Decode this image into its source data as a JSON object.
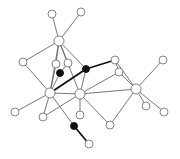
{
  "diagram": {
    "type": "network-graph",
    "nodes": [
      {
        "id": 0,
        "x": 52,
        "y": 14,
        "r": 4,
        "filled": false
      },
      {
        "id": 1,
        "x": 81,
        "y": 12,
        "r": 4,
        "filled": false
      },
      {
        "id": 2,
        "x": 59,
        "y": 41,
        "r": 5,
        "filled": false
      },
      {
        "id": 3,
        "x": 23,
        "y": 62,
        "r": 4,
        "filled": false
      },
      {
        "id": 4,
        "x": 56,
        "y": 64,
        "r": 4,
        "filled": false
      },
      {
        "id": 5,
        "x": 68,
        "y": 63,
        "r": 4,
        "filled": false
      },
      {
        "id": 6,
        "x": 60,
        "y": 73,
        "r": 3.5,
        "filled": true
      },
      {
        "id": 7,
        "x": 86,
        "y": 69,
        "r": 3.5,
        "filled": true
      },
      {
        "id": 8,
        "x": 115,
        "y": 60,
        "r": 4,
        "filled": false
      },
      {
        "id": 9,
        "x": 119,
        "y": 72,
        "r": 4,
        "filled": false
      },
      {
        "id": 10,
        "x": 163,
        "y": 60,
        "r": 4,
        "filled": false
      },
      {
        "id": 11,
        "x": 136,
        "y": 89,
        "r": 5,
        "filled": false
      },
      {
        "id": 12,
        "x": 50,
        "y": 93,
        "r": 5,
        "filled": false
      },
      {
        "id": 13,
        "x": 80,
        "y": 94,
        "r": 5,
        "filled": false
      },
      {
        "id": 14,
        "x": 15,
        "y": 112,
        "r": 4,
        "filled": false
      },
      {
        "id": 15,
        "x": 43,
        "y": 117,
        "r": 4,
        "filled": false
      },
      {
        "id": 16,
        "x": 80,
        "y": 115,
        "r": 4,
        "filled": false
      },
      {
        "id": 17,
        "x": 146,
        "y": 106,
        "r": 4,
        "filled": false
      },
      {
        "id": 18,
        "x": 164,
        "y": 112,
        "r": 4,
        "filled": false
      },
      {
        "id": 19,
        "x": 110,
        "y": 125,
        "r": 4,
        "filled": false
      },
      {
        "id": 20,
        "x": 74,
        "y": 126,
        "r": 3.5,
        "filled": true
      },
      {
        "id": 21,
        "x": 89,
        "y": 144,
        "r": 4,
        "filled": false
      }
    ],
    "edges": [
      {
        "from": 0,
        "to": 2,
        "thick": false
      },
      {
        "from": 1,
        "to": 2,
        "thick": false
      },
      {
        "from": 2,
        "to": 3,
        "thick": false
      },
      {
        "from": 2,
        "to": 12,
        "thick": false
      },
      {
        "from": 2,
        "to": 4,
        "thick": false
      },
      {
        "from": 2,
        "to": 5,
        "thick": false
      },
      {
        "from": 2,
        "to": 13,
        "thick": false
      },
      {
        "from": 2,
        "to": 7,
        "thick": false
      },
      {
        "from": 3,
        "to": 12,
        "thick": false
      },
      {
        "from": 4,
        "to": 12,
        "thick": false
      },
      {
        "from": 5,
        "to": 6,
        "thick": false
      },
      {
        "from": 6,
        "to": 12,
        "thick": false
      },
      {
        "from": 12,
        "to": 7,
        "thick": true
      },
      {
        "from": 7,
        "to": 8,
        "thick": true
      },
      {
        "from": 7,
        "to": 13,
        "thick": false
      },
      {
        "from": 8,
        "to": 9,
        "thick": false
      },
      {
        "from": 8,
        "to": 11,
        "thick": false
      },
      {
        "from": 9,
        "to": 13,
        "thick": false
      },
      {
        "from": 9,
        "to": 11,
        "thick": false
      },
      {
        "from": 10,
        "to": 11,
        "thick": false
      },
      {
        "from": 11,
        "to": 13,
        "thick": false
      },
      {
        "from": 11,
        "to": 17,
        "thick": false
      },
      {
        "from": 11,
        "to": 18,
        "thick": false
      },
      {
        "from": 11,
        "to": 19,
        "thick": false
      },
      {
        "from": 13,
        "to": 19,
        "thick": false
      },
      {
        "from": 13,
        "to": 16,
        "thick": false
      },
      {
        "from": 13,
        "to": 15,
        "thick": false
      },
      {
        "from": 12,
        "to": 13,
        "thick": false
      },
      {
        "from": 12,
        "to": 14,
        "thick": false
      },
      {
        "from": 12,
        "to": 15,
        "thick": false
      },
      {
        "from": 12,
        "to": 20,
        "thick": false
      },
      {
        "from": 20,
        "to": 21,
        "thick": true
      }
    ]
  }
}
